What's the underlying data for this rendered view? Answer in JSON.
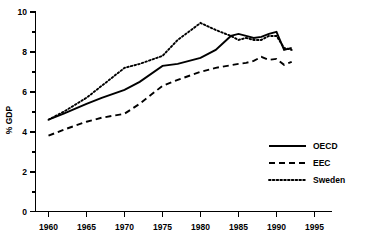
{
  "chart_data": {
    "type": "line",
    "title": "",
    "xlabel": "",
    "ylabel": "% GDP",
    "xlim": [
      1958,
      1996
    ],
    "ylim": [
      0,
      10
    ],
    "grid": false,
    "legend_position": "inside-right",
    "x_ticks": [
      "1960",
      "1965",
      "1970",
      "1975",
      "1980",
      "1985",
      "1990",
      "1995"
    ],
    "x_tick_values": [
      1960,
      1965,
      1970,
      1975,
      1980,
      1985,
      1990,
      1995
    ],
    "y_ticks": [
      "0",
      "2",
      "4",
      "6",
      "8",
      "10"
    ],
    "y_tick_values": [
      0,
      2,
      4,
      6,
      8,
      10
    ],
    "y_minor_tick_values": [
      1,
      3,
      5,
      7,
      9
    ],
    "series": [
      {
        "name": "OECD",
        "style": "solid",
        "x": [
          1960,
          1962,
          1965,
          1967,
          1970,
          1972,
          1975,
          1977,
          1980,
          1982,
          1984,
          1985,
          1986,
          1987,
          1988,
          1989,
          1990,
          1991,
          1992
        ],
        "values": [
          4.6,
          4.9,
          5.4,
          5.7,
          6.1,
          6.5,
          7.3,
          7.4,
          7.7,
          8.1,
          8.8,
          8.9,
          8.8,
          8.7,
          8.75,
          8.9,
          9.0,
          8.1,
          8.2
        ]
      },
      {
        "name": "EEC",
        "style": "dashed",
        "x": [
          1960,
          1962,
          1965,
          1967,
          1970,
          1972,
          1975,
          1977,
          1980,
          1982,
          1985,
          1986,
          1987,
          1988,
          1989,
          1990,
          1991,
          1992
        ],
        "values": [
          3.8,
          4.1,
          4.5,
          4.7,
          4.9,
          5.4,
          6.3,
          6.6,
          7.0,
          7.2,
          7.4,
          7.45,
          7.55,
          7.75,
          7.6,
          7.65,
          7.35,
          7.5
        ]
      },
      {
        "name": "Sweden",
        "style": "dotted",
        "x": [
          1960,
          1962,
          1965,
          1967,
          1970,
          1972,
          1975,
          1977,
          1980,
          1982,
          1984,
          1985,
          1986,
          1987,
          1988,
          1989,
          1990,
          1991,
          1992
        ],
        "values": [
          4.6,
          5.0,
          5.7,
          6.3,
          7.2,
          7.4,
          7.8,
          8.6,
          9.45,
          9.1,
          8.8,
          8.6,
          8.7,
          8.6,
          8.6,
          8.8,
          8.8,
          8.2,
          8.1
        ]
      }
    ]
  },
  "legend": {
    "items": [
      {
        "label": "OECD"
      },
      {
        "label": "EEC"
      },
      {
        "label": "Sweden"
      }
    ]
  },
  "colors": {
    "ink": "#000000",
    "background": "#ffffff"
  }
}
